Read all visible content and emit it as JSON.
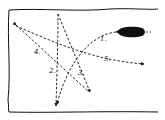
{
  "diagram": {
    "colors": {
      "ink": "#111111",
      "background": "#ffffff"
    },
    "object": {
      "shape": "oval",
      "fill": "#111111"
    },
    "paths": [
      {
        "id": "1",
        "label": "1."
      },
      {
        "id": "2",
        "label": "2."
      },
      {
        "id": "3",
        "label": "3."
      },
      {
        "id": "4",
        "label": "4."
      },
      {
        "id": "5",
        "label": "5."
      }
    ]
  }
}
